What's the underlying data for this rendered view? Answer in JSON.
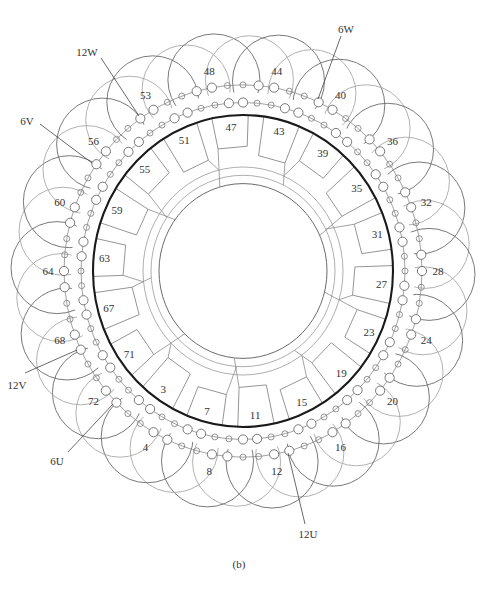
{
  "figure": {
    "caption": "(b)"
  },
  "diagram": {
    "outer_labels": [
      "48",
      "44",
      "40",
      "36",
      "32",
      "28",
      "24",
      "20",
      "16",
      "12",
      "8",
      "4",
      "72",
      "68",
      "64",
      "60",
      "56",
      "53"
    ],
    "inner_labels": [
      "47",
      "43",
      "39",
      "35",
      "31",
      "27",
      "23",
      "19",
      "15",
      "11",
      "7",
      "3",
      "71",
      "67",
      "63",
      "59",
      "55",
      "51"
    ],
    "leads": {
      "w12": "12W",
      "w6": "6W",
      "v6": "6V",
      "v12": "12V",
      "u6": "6U",
      "u12": "12U"
    }
  }
}
